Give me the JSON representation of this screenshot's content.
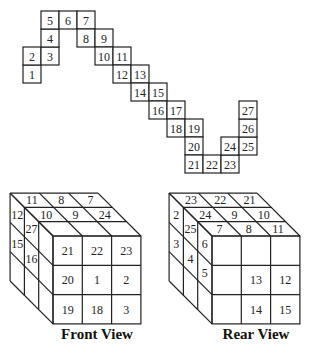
{
  "net": {
    "origin": [
      23,
      11
    ],
    "cell_size": 18,
    "cells": [
      {
        "label": "1",
        "col": 0,
        "row": 3
      },
      {
        "label": "2",
        "col": 0,
        "row": 2
      },
      {
        "label": "3",
        "col": 1,
        "row": 2
      },
      {
        "label": "4",
        "col": 1,
        "row": 1
      },
      {
        "label": "5",
        "col": 1,
        "row": 0
      },
      {
        "label": "6",
        "col": 2,
        "row": 0
      },
      {
        "label": "7",
        "col": 3,
        "row": 0
      },
      {
        "label": "8",
        "col": 3,
        "row": 1
      },
      {
        "label": "9",
        "col": 4,
        "row": 1
      },
      {
        "label": "10",
        "col": 4,
        "row": 2
      },
      {
        "label": "11",
        "col": 5,
        "row": 2
      },
      {
        "label": "12",
        "col": 5,
        "row": 3
      },
      {
        "label": "13",
        "col": 6,
        "row": 3
      },
      {
        "label": "14",
        "col": 6,
        "row": 4
      },
      {
        "label": "15",
        "col": 7,
        "row": 4
      },
      {
        "label": "16",
        "col": 7,
        "row": 5
      },
      {
        "label": "17",
        "col": 8,
        "row": 5
      },
      {
        "label": "18",
        "col": 8,
        "row": 6
      },
      {
        "label": "19",
        "col": 9,
        "row": 6
      },
      {
        "label": "20",
        "col": 9,
        "row": 7
      },
      {
        "label": "21",
        "col": 9,
        "row": 8
      },
      {
        "label": "22",
        "col": 10,
        "row": 8
      },
      {
        "label": "23",
        "col": 11,
        "row": 8
      },
      {
        "label": "24",
        "col": 11,
        "row": 7
      },
      {
        "label": "25",
        "col": 12,
        "row": 7
      },
      {
        "label": "26",
        "col": 12,
        "row": 6
      },
      {
        "label": "27",
        "col": 12,
        "row": 5
      }
    ]
  },
  "front_view": {
    "caption": "Front View",
    "front_face": [
      [
        "21",
        "22",
        "23"
      ],
      [
        "20",
        "1",
        "2"
      ],
      [
        "19",
        "18",
        "3"
      ]
    ],
    "top_face": [
      [
        "11",
        "8",
        "7"
      ],
      [
        "10",
        "9",
        "24"
      ],
      [
        "",
        "",
        ""
      ]
    ],
    "left_face": [
      [
        "12",
        "27",
        ""
      ],
      [
        "15",
        "16",
        ""
      ],
      [
        "",
        "",
        ""
      ]
    ]
  },
  "rear_view": {
    "caption": "Rear View",
    "front_face": [
      [
        "",
        "",
        ""
      ],
      [
        "",
        "13",
        "12"
      ],
      [
        "",
        "14",
        "15"
      ]
    ],
    "top_face": [
      [
        "23",
        "22",
        "21"
      ],
      [
        "24",
        "9",
        "10"
      ],
      [
        "7",
        "8",
        "11"
      ]
    ],
    "left_face": [
      [
        "2",
        "25",
        "6"
      ],
      [
        "3",
        "4",
        "5"
      ],
      [
        "",
        "",
        ""
      ]
    ]
  }
}
